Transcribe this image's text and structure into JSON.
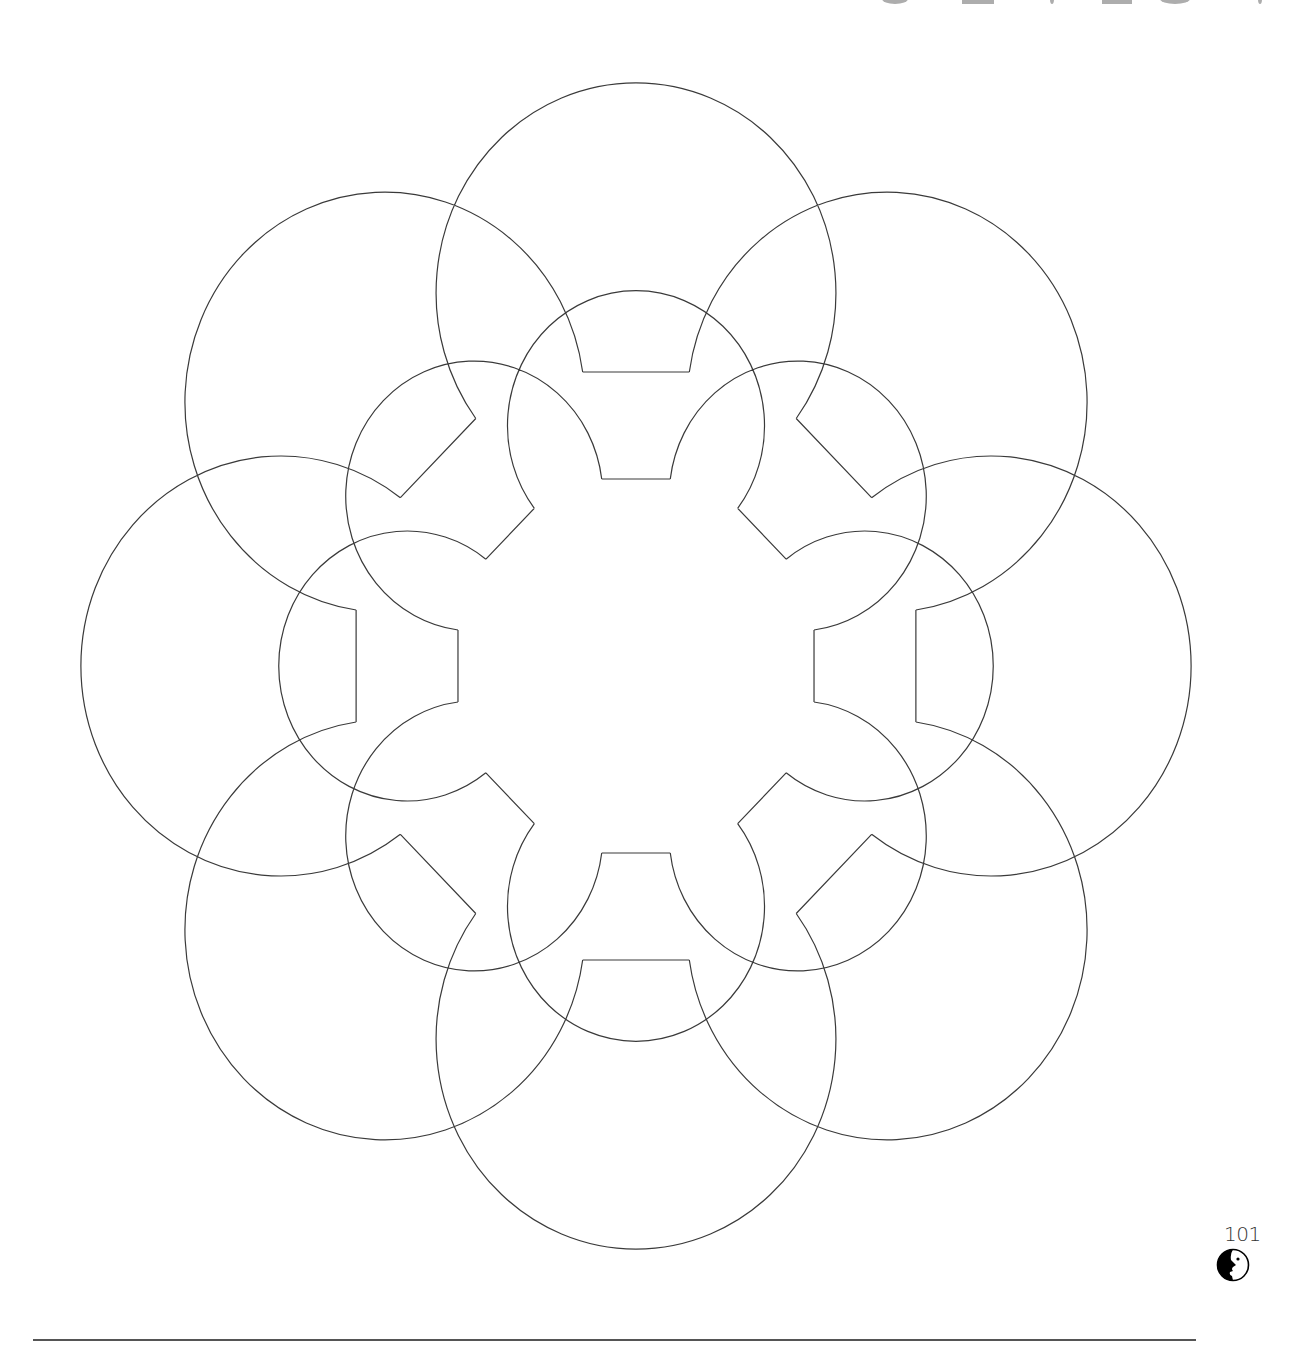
{
  "page": {
    "page_number": "101",
    "title_visible": false
  },
  "logo": {
    "icon": "face-profile-icon",
    "color": "#000000"
  },
  "figure": {
    "stroke_color": "#3a3a3a",
    "stroke_width": 1.2,
    "center": [
      636,
      666
    ],
    "x_scale": 0.952,
    "rings": [
      {
        "name": "outer",
        "count": 8,
        "distance": 394,
        "radius": 210,
        "notch_depth": 294,
        "notch_half_width": 56
      },
      {
        "name": "inner",
        "count": 8,
        "distance": 249,
        "radius": 135,
        "notch_depth": 187,
        "notch_half_width": 36
      }
    ]
  },
  "footer": {
    "rule_color": "#555555"
  }
}
